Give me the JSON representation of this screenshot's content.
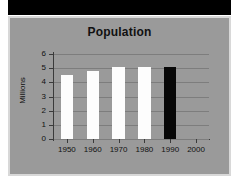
{
  "chart_data": {
    "type": "bar",
    "title": "Population",
    "xlabel": "",
    "ylabel": "Millions",
    "categories": [
      "1950",
      "1960",
      "1970",
      "1980",
      "1990",
      "2000"
    ],
    "values": [
      4.5,
      4.8,
      5.1,
      5.1,
      5.1,
      null
    ],
    "bar_colors": [
      "#ffffff",
      "#ffffff",
      "#ffffff",
      "#ffffff",
      "#000000",
      null
    ],
    "ylim": [
      0,
      6
    ],
    "ytick_labels": [
      "0",
      "1",
      "2",
      "3",
      "4",
      "5",
      "6"
    ],
    "ytick_values": [
      0,
      1,
      2,
      3,
      4,
      5,
      6
    ],
    "grid": true,
    "legend": null,
    "series": [
      {
        "name": "Population",
        "values": [
          4.5,
          4.8,
          5.1,
          5.1,
          5.1,
          null
        ]
      }
    ],
    "background_color": "#9a9a9a",
    "gridline_color": "#7d7d7d",
    "axis_color": "#3a3a3a",
    "text_color": "#111111"
  },
  "frame": {
    "border_color": "#d8d8d8",
    "band_color": "#000000"
  }
}
